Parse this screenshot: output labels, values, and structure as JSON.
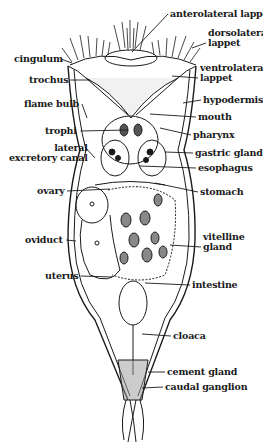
{
  "diagram": {
    "labels_right": [
      {
        "id": "anterolateral-lappet",
        "text": "anterolateral lappet",
        "x": 170,
        "y": 9,
        "tx": 132,
        "ty": 52
      },
      {
        "id": "dorsolateral-lappet",
        "text": "dorsolateral\nlappet",
        "x": 208,
        "y": 28,
        "tx": 192,
        "ty": 48
      },
      {
        "id": "ventrolateral-lappet",
        "text": "ventrolateral\nlappet",
        "x": 200,
        "y": 63,
        "tx": 172,
        "ty": 76
      },
      {
        "id": "hypodermis",
        "text": "hypodermis",
        "x": 203,
        "y": 95,
        "tx": 183,
        "ty": 103
      },
      {
        "id": "mouth",
        "text": "mouth",
        "x": 198,
        "y": 112,
        "tx": 150,
        "ty": 114
      },
      {
        "id": "pharynx",
        "text": "pharynx",
        "x": 193,
        "y": 130,
        "tx": 160,
        "ty": 128
      },
      {
        "id": "gastric-gland",
        "text": "gastric gland",
        "x": 195,
        "y": 148,
        "tx": 165,
        "ty": 152
      },
      {
        "id": "esophagus",
        "text": "esophagus",
        "x": 198,
        "y": 163,
        "tx": 140,
        "ty": 166
      },
      {
        "id": "stomach",
        "text": "stomach",
        "x": 200,
        "y": 187,
        "tx": 155,
        "ty": 183
      },
      {
        "id": "vitelline-gland",
        "text": "vitelline\ngland",
        "x": 203,
        "y": 232,
        "tx": 170,
        "ty": 245
      },
      {
        "id": "intestine",
        "text": "intestine",
        "x": 192,
        "y": 280,
        "tx": 145,
        "ty": 283
      },
      {
        "id": "cloaca",
        "text": "cloaca",
        "x": 173,
        "y": 331,
        "tx": 142,
        "ty": 334
      },
      {
        "id": "cement-gland",
        "text": "cement gland",
        "x": 167,
        "y": 367,
        "tx": 148,
        "ty": 372
      },
      {
        "id": "caudal-ganglion",
        "text": "caudal ganglion",
        "x": 165,
        "y": 382,
        "tx": 142,
        "ty": 388
      }
    ],
    "labels_left": [
      {
        "id": "cingulum",
        "text": "cingulum",
        "x": 14,
        "y": 54,
        "tx": 72,
        "ty": 63
      },
      {
        "id": "trochus",
        "text": "trochus",
        "x": 29,
        "y": 75,
        "tx": 90,
        "ty": 80
      },
      {
        "id": "flame-bulb",
        "text": "flame bulb",
        "x": 24,
        "y": 99,
        "tx": 87,
        "ty": 118
      },
      {
        "id": "trophi",
        "text": "trophi",
        "x": 45,
        "y": 126,
        "tx": 128,
        "ty": 130
      },
      {
        "id": "lateral-excretory-canal",
        "text": "lateral\nexcretory canal",
        "x": 9,
        "y": 143,
        "tx": 85,
        "ty": 147
      },
      {
        "id": "ovary",
        "text": "ovary",
        "x": 37,
        "y": 186,
        "tx": 110,
        "ty": 189
      },
      {
        "id": "oviduct",
        "text": "oviduct",
        "x": 25,
        "y": 235,
        "tx": 76,
        "ty": 241
      },
      {
        "id": "uterus",
        "text": "uterus",
        "x": 45,
        "y": 271,
        "tx": 112,
        "ty": 277
      }
    ]
  }
}
